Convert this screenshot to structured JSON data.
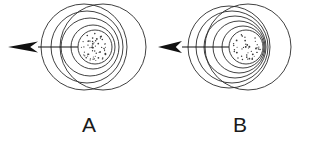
{
  "figure": {
    "background_color": "#ffffff",
    "line_color": "#2b2b2b",
    "arrow_color": "#111111",
    "label_color": "#1a1a1a",
    "width": 313,
    "height": 147
  },
  "panels": [
    {
      "id": "A",
      "label": "A",
      "label_x": 89,
      "label_y": 132,
      "source": {
        "center_x": 95,
        "center_y": 47,
        "radius": 17,
        "stipple_dots": 58
      },
      "arrow": {
        "tail_x": 95,
        "tip_x": 8,
        "y": 47,
        "head_length": 30,
        "head_half_width": 5.5
      },
      "wavefronts": [
        {
          "cx": 93,
          "cy": 47,
          "r": 22
        },
        {
          "cx": 90,
          "cy": 47,
          "r": 29
        },
        {
          "cx": 87,
          "cy": 47,
          "r": 36
        },
        {
          "cx": 84,
          "cy": 47,
          "r": 43
        },
        {
          "cx": 103,
          "cy": 47,
          "r": 43
        }
      ]
    },
    {
      "id": "B",
      "label": "B",
      "label_x": 240,
      "label_y": 132,
      "source": {
        "center_x": 246,
        "center_y": 47,
        "radius": 17,
        "stipple_dots": 46
      },
      "arrow": {
        "tail_x": 246,
        "tip_x": 158,
        "y": 47,
        "head_length": 24,
        "head_half_width": 6
      },
      "wavefronts": [
        {
          "cx": 243,
          "cy": 47,
          "r": 21
        },
        {
          "cx": 239,
          "cy": 47,
          "r": 26
        },
        {
          "cx": 235,
          "cy": 47,
          "r": 31
        },
        {
          "cx": 232,
          "cy": 47,
          "r": 36
        },
        {
          "cx": 229,
          "cy": 47,
          "r": 41
        },
        {
          "cx": 248,
          "cy": 47,
          "r": 43
        }
      ]
    }
  ],
  "chart_data": {
    "type": "diagram",
    "panel_labels": [
      "A",
      "B"
    ],
    "series": [
      {
        "name": "A",
        "wavefront_count": 5,
        "wavefront_radii": [
          22,
          29,
          36,
          43,
          43
        ],
        "center_offsets_x": [
          -2,
          -5,
          -8,
          -11,
          8
        ],
        "source_radius": 17,
        "arrow_direction": "left",
        "arrow_length": 87,
        "compression": "moderate"
      },
      {
        "name": "B",
        "wavefront_count": 6,
        "wavefront_radii": [
          21,
          26,
          31,
          36,
          41,
          43
        ],
        "center_offsets_x": [
          -3,
          -7,
          -11,
          -14,
          -17,
          2
        ],
        "source_radius": 17,
        "arrow_direction": "left",
        "arrow_length": 88,
        "compression": "strong"
      }
    ]
  }
}
